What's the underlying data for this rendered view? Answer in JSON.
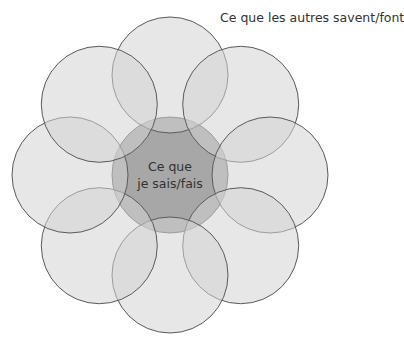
{
  "diagram": {
    "outer_label": "Ce que les autres savent/font",
    "center_label_line1": "Ce que",
    "center_label_line2": "je sais/fais",
    "center": {
      "cx": 170,
      "cy": 175,
      "r": 58
    },
    "outer_radius": 58,
    "outer_distance": 100,
    "outer_count": 8,
    "colors": {
      "fill": "#d4d4d4",
      "fill_opacity": 0.55,
      "center_fill": "#8a8a8a",
      "stroke": "#5a5a5a"
    }
  }
}
